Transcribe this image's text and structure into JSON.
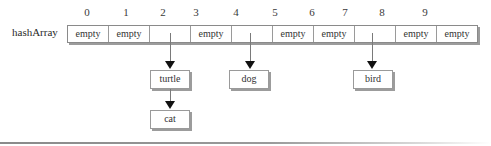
{
  "diagram": {
    "array_label": "hashArray",
    "indices": [
      "0",
      "1",
      "2",
      "3",
      "4",
      "5",
      "6",
      "7",
      "8",
      "9"
    ],
    "cells": [
      "empty",
      "empty",
      "",
      "empty",
      "",
      "empty",
      "empty",
      "",
      "empty",
      "empty"
    ],
    "chains": [
      {
        "index": 2,
        "nodes": [
          "turtle",
          "cat"
        ]
      },
      {
        "index": 4,
        "nodes": [
          "dog"
        ]
      },
      {
        "index": 7,
        "nodes": [
          "bird"
        ]
      }
    ]
  }
}
